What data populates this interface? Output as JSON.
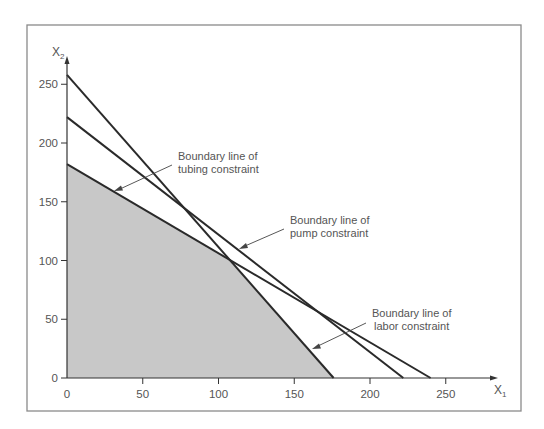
{
  "chart_data": {
    "type": "line",
    "title": "",
    "xlabel": "X1",
    "ylabel": "X2",
    "xlim": [
      0,
      280
    ],
    "ylim": [
      0,
      260
    ],
    "x_ticks": [
      0,
      50,
      100,
      150,
      200,
      250
    ],
    "y_ticks": [
      0,
      50,
      100,
      150,
      200,
      250
    ],
    "grid": false,
    "series": [
      {
        "name": "Labor constraint boundary",
        "points": [
          [
            0,
            258
          ],
          [
            176,
            0
          ]
        ]
      },
      {
        "name": "Pump constraint boundary",
        "points": [
          [
            0,
            222
          ],
          [
            222,
            0
          ]
        ]
      },
      {
        "name": "Tubing constraint boundary",
        "points": [
          [
            0,
            182
          ],
          [
            240,
            0
          ]
        ]
      }
    ],
    "feasible_region": {
      "fill": "#c8c8c8",
      "vertices": [
        [
          0,
          0
        ],
        [
          0,
          182
        ],
        [
          108,
          100
        ],
        [
          176,
          0
        ]
      ]
    },
    "annotations": [
      {
        "line1": "Boundary line of",
        "line2": "tubing constraint",
        "arrow_to": [
          32,
          158
        ]
      },
      {
        "line1": "Boundary line of",
        "line2": "pump constraint",
        "arrow_to": [
          114,
          112
        ]
      },
      {
        "line1": "Boundary line of",
        "line2": "labor constraint",
        "arrow_to": [
          163,
          20
        ]
      }
    ]
  },
  "axes": {
    "x_title_main": "X",
    "x_title_sub": "1",
    "y_title_main": "X",
    "y_title_sub": "2"
  },
  "labels": {
    "tubing_l1": "Boundary line of",
    "tubing_l2": "tubing constraint",
    "pump_l1": "Boundary line of",
    "pump_l2": "pump constraint",
    "labor_l1": "Boundary line of",
    "labor_l2": "labor constraint"
  },
  "ticks": {
    "x": [
      "0",
      "50",
      "100",
      "150",
      "200",
      "250"
    ],
    "y": [
      "0",
      "50",
      "100",
      "150",
      "200",
      "250"
    ]
  },
  "colors": {
    "line": "#2a2a2a",
    "feasible_fill": "#c8c8c8",
    "frame": "#8a8a8a",
    "text": "#555555"
  }
}
